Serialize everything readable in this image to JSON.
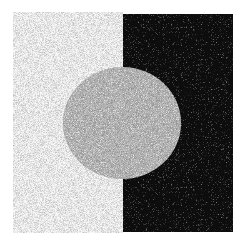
{
  "figure": {
    "colors": {
      "background": "#ffffff",
      "left_field": "#f7f7f7",
      "right_field": "#0d0d0d",
      "disc": "#b5b5b5"
    },
    "regions": {
      "left_field": {
        "x": 13,
        "y": 12,
        "w": 110,
        "h": 221
      },
      "right_field": {
        "x": 123,
        "y": 14,
        "w": 110,
        "h": 218
      },
      "disc": {
        "cx": 122,
        "cy": 123,
        "rx": 59,
        "ry": 56
      }
    }
  }
}
